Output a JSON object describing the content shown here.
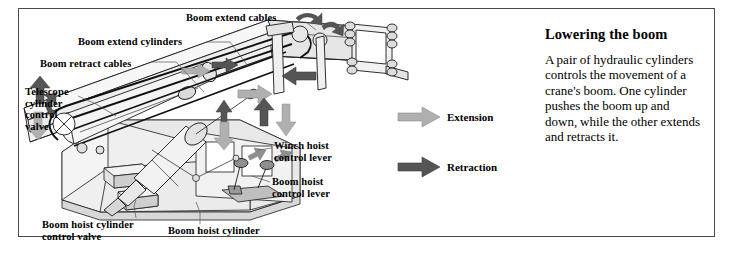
{
  "figure": {
    "labels": [
      {
        "id": "boom-extend-cables",
        "text": "Boom extend cables",
        "x": 186,
        "y": 12,
        "align": "left"
      },
      {
        "id": "boom-extend-cylinders",
        "text": "Boom extend cylinders",
        "x": 78,
        "y": 36,
        "align": "left"
      },
      {
        "id": "boom-retract-cables",
        "text": "Boom retract cables",
        "x": 40,
        "y": 58,
        "align": "left"
      },
      {
        "id": "telescope-cylinder-control-valve",
        "text": "Telescope\ncylinder\ncontrol\nvalve",
        "x": 25,
        "y": 86,
        "align": "left"
      },
      {
        "id": "winch-hoist-control-lever",
        "text": "Winch hoist\ncontrol lever",
        "x": 274,
        "y": 140,
        "align": "left"
      },
      {
        "id": "boom-hoist-control-lever",
        "text": "Boom hoist\ncontrol lever",
        "x": 272,
        "y": 176,
        "align": "left"
      },
      {
        "id": "boom-hoist-cylinder-control-valve",
        "text": "Boom hoist cylinder\ncontrol valve",
        "x": 42,
        "y": 222,
        "align": "left"
      },
      {
        "id": "boom-hoist-cylinder",
        "text": "Boom hoist cylinder",
        "x": 168,
        "y": 228,
        "align": "left"
      }
    ],
    "legend": [
      {
        "id": "extension",
        "label": "Extension",
        "color": "#b0b0b0",
        "x": 398,
        "y": 113
      },
      {
        "id": "retraction",
        "label": "Retraction",
        "color": "#555555",
        "x": 398,
        "y": 163
      }
    ]
  },
  "panel": {
    "title": "Lowering the boom",
    "body": "A pair of hydraulic cylinders controls the movement of a crane's boom. One cylinder pushes the boom up and down, while the other extends and retracts it."
  },
  "colors": {
    "border": "#4a4a4a",
    "extension_arrow": "#b0b0b0",
    "retraction_arrow": "#555555",
    "machine_fill": "#efefef",
    "machine_shade": "#d8d8d8",
    "outline": "#1a1a1a"
  }
}
